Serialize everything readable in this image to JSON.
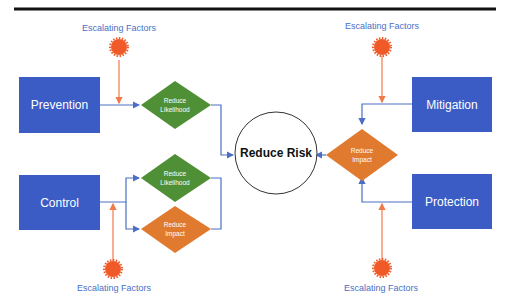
{
  "diagram": {
    "center": {
      "label": "Reduce Risk"
    },
    "boxes": {
      "prevention": "Prevention",
      "control": "Control",
      "mitigation": "Mitigation",
      "protection": "Protection"
    },
    "diamonds": {
      "left_top": "Reduce Likelihood",
      "left_mid": "Reduce Likelihood",
      "left_bottom": "Reduce Impact",
      "right": "Reduce Impact"
    },
    "escalating_factors": [
      "Escalating Factors",
      "Escalating Factors",
      "Escalating Factors",
      "Escalating Factors"
    ],
    "colors": {
      "box_blue": "#3a5cc4",
      "green": "#4f8f36",
      "orange": "#e07a2e",
      "star_red": "#f05a28",
      "connector_blue": "#4a6fc4",
      "connector_orange": "#f07a4a"
    }
  }
}
